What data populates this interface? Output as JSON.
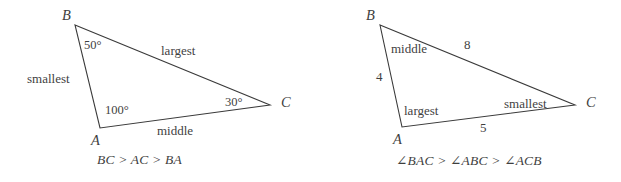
{
  "figures": [
    {
      "id": "triangle-angles-figure",
      "caption": "BC > AC > BA",
      "vertices": [
        {
          "name": "B",
          "label": "B",
          "x": 75,
          "y": 25
        },
        {
          "name": "A",
          "label": "A",
          "x": 100,
          "y": 128
        },
        {
          "name": "C",
          "label": "C",
          "x": 270,
          "y": 105
        }
      ],
      "vertex_labels": [
        {
          "name": "B",
          "label": "B",
          "x": 62,
          "y": 8
        },
        {
          "name": "A",
          "label": "A",
          "x": 91,
          "y": 133
        },
        {
          "name": "C",
          "label": "C",
          "x": 281,
          "y": 95
        }
      ],
      "angle_labels": [
        {
          "at": "B",
          "label": "50°",
          "x": 84,
          "y": 39
        },
        {
          "at": "A",
          "label": "100°",
          "x": 105,
          "y": 104
        },
        {
          "at": "C",
          "label": "30°",
          "x": 225,
          "y": 96
        }
      ],
      "side_labels": [
        {
          "side": "BA",
          "label": "smallest",
          "x": 27,
          "y": 72
        },
        {
          "side": "BC",
          "label": "largest",
          "x": 161,
          "y": 44
        },
        {
          "side": "AC",
          "label": "middle",
          "x": 157,
          "y": 124
        }
      ]
    },
    {
      "id": "triangle-sides-figure",
      "caption": "∠BAC > ∠ABC > ∠ACB",
      "vertices": [
        {
          "name": "B",
          "label": "B",
          "x": 380,
          "y": 25
        },
        {
          "name": "A",
          "label": "A",
          "x": 402,
          "y": 127
        },
        {
          "name": "C",
          "label": "C",
          "x": 575,
          "y": 105
        }
      ],
      "vertex_labels": [
        {
          "name": "B",
          "label": "B",
          "x": 366,
          "y": 8
        },
        {
          "name": "A",
          "label": "A",
          "x": 393,
          "y": 132
        },
        {
          "name": "C",
          "label": "C",
          "x": 586,
          "y": 95
        }
      ],
      "side_labels": [
        {
          "side": "AB",
          "label": "middle",
          "x": 391,
          "y": 42
        },
        {
          "side": "AB",
          "label": "4",
          "x": 376,
          "y": 70
        },
        {
          "side": "BC",
          "label": "8",
          "x": 464,
          "y": 38
        },
        {
          "side": "AC",
          "label": "5",
          "x": 480,
          "y": 121
        },
        {
          "side": "AC",
          "label": "smallest",
          "x": 504,
          "y": 97
        },
        {
          "side": "angle-A",
          "label": "largest",
          "x": 404,
          "y": 104
        }
      ]
    }
  ],
  "captions": [
    {
      "text": "BC > AC > BA",
      "x": 97,
      "y": 152
    },
    {
      "text": "∠BAC > ∠ABC > ∠ACB",
      "x": 396,
      "y": 152
    }
  ],
  "style": {
    "stroke_color": "#3a3a3a",
    "stroke_width": 1.1,
    "text_color": "#3f3f3f",
    "background": "#ffffff"
  },
  "chart_data": {
    "type": "diagram",
    "subtitle": "",
    "figures": [
      {
        "name": "left-triangle",
        "given": "angles",
        "caption": "BC > AC > BA",
        "points": {
          "A": [
            100,
            128
          ],
          "B": [
            75,
            25
          ],
          "C": [
            270,
            105
          ]
        },
        "angles": {
          "A": 100,
          "B": 50,
          "C": 30
        },
        "angle_unit": "degrees",
        "side_descriptions": {
          "BC": "largest",
          "AC": "middle",
          "BA": "smallest"
        }
      },
      {
        "name": "right-triangle",
        "given": "sides",
        "caption": "∠BAC > ∠ABC > ∠ACB",
        "points": {
          "A": [
            402,
            127
          ],
          "B": [
            380,
            25
          ],
          "C": [
            575,
            105
          ]
        },
        "sides": {
          "AB": 4,
          "BC": 8,
          "AC": 5
        },
        "side_descriptions": {
          "BC": "largest",
          "AC": "smallest",
          "AB": "middle"
        },
        "angle_descriptions": {
          "BAC": "largest",
          "ABC": "middle",
          "ACB": "smallest"
        }
      }
    ]
  }
}
